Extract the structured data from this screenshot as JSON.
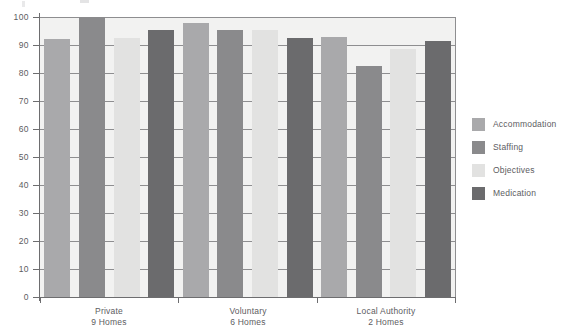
{
  "chart_data": {
    "type": "bar",
    "title": "",
    "subtitle": "",
    "xlabel": "",
    "ylabel": "",
    "ylim": [
      0,
      100
    ],
    "ytick_step": 10,
    "ytick_labels": [
      "100",
      "90",
      "80",
      "70",
      "60",
      "50",
      "40",
      "30",
      "20",
      "10",
      "0"
    ],
    "grid": true,
    "legend_position": "right",
    "categories": [
      "Private",
      "Voluntary",
      "Local Authority"
    ],
    "category_sublabels": [
      "9 Homes",
      "6 Homes",
      "2 Homes"
    ],
    "series": [
      {
        "name": "Accommodation",
        "color": "#a9a9ab",
        "values": [
          92,
          98,
          93
        ]
      },
      {
        "name": "Staffing",
        "color": "#8a8a8c",
        "values": [
          100,
          95.5,
          82.5
        ]
      },
      {
        "name": "Objectives",
        "color": "#e2e2e1",
        "values": [
          92.5,
          95.5,
          88.5
        ]
      },
      {
        "name": "Medication",
        "color": "#6b6b6d",
        "values": [
          95.5,
          92.5,
          91.5
        ]
      }
    ]
  },
  "legend": {
    "items": [
      {
        "label": "Accommodation"
      },
      {
        "label": "Staffing"
      },
      {
        "label": "Objectives"
      },
      {
        "label": "Medication"
      }
    ]
  },
  "axis": {
    "y_labels": [
      "100",
      "90",
      "80",
      "70",
      "60",
      "50",
      "40",
      "30",
      "20",
      "10",
      "0"
    ]
  },
  "categories": [
    {
      "name": "Private",
      "sub": "9 Homes"
    },
    {
      "name": "Voluntary",
      "sub": "6 Homes"
    },
    {
      "name": "Local Authority",
      "sub": "2 Homes"
    }
  ],
  "colors": {
    "plot_background": "#f2f2f1",
    "axis": "#6d6d6f",
    "gridline": "#8e8e90",
    "text": "#5d5d5f"
  }
}
